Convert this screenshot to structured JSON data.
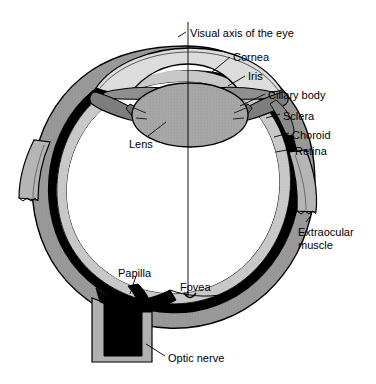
{
  "figure": {
    "type": "anatomical-diagram",
    "width": 376,
    "height": 384,
    "background": "#ffffff"
  },
  "colors": {
    "outline": "#000000",
    "sclera": "#9a9a9a",
    "choroid": "#000000",
    "retina": "#c9c9c9",
    "cornea": "#dcdcdc",
    "lens": "#a8a8a8",
    "iris": "#8f8f8f",
    "ciliary_body": "#7d7d7d",
    "vitreous": "#ffffff",
    "optic_nerve": "#000000",
    "muscle": "#b5b5b5",
    "leader_line": "#000000"
  },
  "labels": [
    {
      "id": "visual-axis",
      "text": "Visual axis of the eye",
      "x": 190,
      "y": 27,
      "align": "left"
    },
    {
      "id": "cornea",
      "text": "Cornea",
      "x": 233,
      "y": 51,
      "align": "left"
    },
    {
      "id": "iris",
      "text": "Iris",
      "x": 248,
      "y": 70,
      "align": "left"
    },
    {
      "id": "ciliary-body",
      "text": "Ciliary body",
      "x": 268,
      "y": 89,
      "align": "left"
    },
    {
      "id": "sclera",
      "text": "Sclera",
      "x": 283,
      "y": 110,
      "align": "left"
    },
    {
      "id": "choroid",
      "text": "Choroid",
      "x": 292,
      "y": 129,
      "align": "left"
    },
    {
      "id": "retina",
      "text": "Retina",
      "x": 295,
      "y": 145,
      "align": "left"
    },
    {
      "id": "lens",
      "text": "Lens",
      "x": 129,
      "y": 138,
      "align": "left"
    },
    {
      "id": "extraocular-muscle",
      "text": "Extraocular\nmuscle",
      "x": 298,
      "y": 226,
      "align": "left"
    },
    {
      "id": "papilla",
      "text": "Papilla",
      "x": 118,
      "y": 267,
      "align": "left"
    },
    {
      "id": "fovea",
      "text": "Fovea",
      "x": 180,
      "y": 281,
      "align": "left"
    },
    {
      "id": "optic-nerve",
      "text": "Optic nerve",
      "x": 168,
      "y": 352,
      "align": "left"
    }
  ],
  "structures": [
    {
      "id": "visual-axis-line",
      "name": "Visual axis",
      "description": "Vertical reference line through cornea, lens and fovea"
    },
    {
      "id": "cornea-dome",
      "name": "Cornea",
      "description": "Transparent light-gray anterior dome"
    },
    {
      "id": "iris-left",
      "name": "Iris (left)",
      "description": "Flap anterior to lens forming the pupil aperture"
    },
    {
      "id": "iris-right",
      "name": "Iris (right)",
      "description": "Flap anterior to lens forming the pupil aperture"
    },
    {
      "id": "lens-body",
      "name": "Lens",
      "description": "Biconvex stippled gray ellipse behind the pupil"
    },
    {
      "id": "ciliary-left",
      "name": "Ciliary body (left)",
      "description": "Wedge joining iris root to sclera"
    },
    {
      "id": "ciliary-right",
      "name": "Ciliary body (right)",
      "description": "Wedge joining iris root to sclera"
    },
    {
      "id": "sclera-wall",
      "name": "Sclera",
      "description": "Outer fibrous gray coat of the globe"
    },
    {
      "id": "choroid-wall",
      "name": "Choroid",
      "description": "Thin black vascular layer inside the sclera"
    },
    {
      "id": "retina-wall",
      "name": "Retina",
      "description": "Inner light-gray neural layer"
    },
    {
      "id": "vitreous-body",
      "name": "Vitreous body",
      "description": "Large white interior cavity"
    },
    {
      "id": "muscle-left",
      "name": "Extraocular muscle (left)",
      "description": "Cut muscle stub with jagged end"
    },
    {
      "id": "muscle-right",
      "name": "Extraocular muscle (right)",
      "description": "Cut muscle stub with jagged end"
    },
    {
      "id": "papilla-disc",
      "name": "Papilla",
      "description": "Optic disc, black region where nerve exits"
    },
    {
      "id": "fovea-pit",
      "name": "Fovea",
      "description": "Central retinal pit on the visual axis"
    },
    {
      "id": "optic-nerve-stalk",
      "name": "Optic nerve",
      "description": "Black nerve trunk with gray sheath leaving inferiorly"
    }
  ]
}
